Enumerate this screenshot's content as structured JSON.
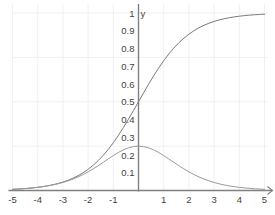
{
  "chart_data": {
    "type": "line",
    "title": "",
    "subtitle": "",
    "xlabel": "",
    "ylabel": "y",
    "xlim": [
      -5,
      5
    ],
    "ylim": [
      0,
      1.04
    ],
    "grid": true,
    "grid_color": "#f0f0f0",
    "legend": "none",
    "axis_color": "#808080",
    "text_color": "#3f3f3f",
    "x_ticks": [
      -5,
      -4,
      -3,
      -2,
      -1,
      1,
      2,
      3,
      4,
      5
    ],
    "x_tick_labels": [
      "-5",
      "-4",
      "-3",
      "-2",
      "-1",
      "1",
      "2",
      "3",
      "4",
      "5"
    ],
    "y_ticks": [
      0.1,
      0.2,
      0.3,
      0.4,
      0.5,
      0.6,
      0.7,
      0.8,
      0.9,
      1
    ],
    "y_tick_labels": [
      "0.1",
      "0.2",
      "0.3",
      "0.4",
      "0.5",
      "0.6",
      "0.7",
      "0.8",
      "0.9",
      "1"
    ],
    "x_gridlines": [
      -5,
      -4,
      -3,
      -2,
      -1,
      0,
      1,
      2,
      3,
      4,
      5
    ],
    "y_gridlines": [
      0.25,
      0.5,
      0.75,
      1
    ],
    "x_axis_arrow": true,
    "series": [
      {
        "name": "sigmoid",
        "color": "#7a7a7a",
        "width": 1,
        "x": [
          -5,
          -4.8,
          -4.6,
          -4.4,
          -4.2,
          -4,
          -3.8,
          -3.6,
          -3.4,
          -3.2,
          -3,
          -2.8,
          -2.6,
          -2.4,
          -2.2,
          -2,
          -1.8,
          -1.6,
          -1.4,
          -1.2,
          -1,
          -0.8,
          -0.6,
          -0.4,
          -0.2,
          0,
          0.2,
          0.4,
          0.6,
          0.8,
          1,
          1.2,
          1.4,
          1.6,
          1.8,
          2,
          2.2,
          2.4,
          2.6,
          2.8,
          3,
          3.2,
          3.4,
          3.6,
          3.8,
          4,
          4.2,
          4.4,
          4.6,
          4.8,
          5
        ],
        "y": [
          0.0067,
          0.0082,
          0.0099,
          0.0121,
          0.0148,
          0.018,
          0.0219,
          0.0266,
          0.0323,
          0.0392,
          0.0474,
          0.0573,
          0.0691,
          0.0832,
          0.0998,
          0.1192,
          0.1419,
          0.168,
          0.1978,
          0.2315,
          0.2689,
          0.31,
          0.3543,
          0.4013,
          0.4502,
          0.5,
          0.5498,
          0.5987,
          0.6457,
          0.69,
          0.7311,
          0.7685,
          0.8022,
          0.832,
          0.8581,
          0.8808,
          0.9002,
          0.9168,
          0.9309,
          0.9427,
          0.9526,
          0.9608,
          0.9677,
          0.9734,
          0.9781,
          0.982,
          0.9852,
          0.9879,
          0.9901,
          0.9918,
          0.9933
        ]
      },
      {
        "name": "sigmoid-derivative",
        "color": "#9a9a9a",
        "width": 1,
        "x": [
          -5,
          -4.8,
          -4.6,
          -4.4,
          -4.2,
          -4,
          -3.8,
          -3.6,
          -3.4,
          -3.2,
          -3,
          -2.8,
          -2.6,
          -2.4,
          -2.2,
          -2,
          -1.8,
          -1.6,
          -1.4,
          -1.2,
          -1,
          -0.8,
          -0.6,
          -0.4,
          -0.2,
          0,
          0.2,
          0.4,
          0.6,
          0.8,
          1,
          1.2,
          1.4,
          1.6,
          1.8,
          2,
          2.2,
          2.4,
          2.6,
          2.8,
          3,
          3.2,
          3.4,
          3.6,
          3.8,
          4,
          4.2,
          4.4,
          4.6,
          4.8,
          5
        ],
        "y": [
          0.0066,
          0.0081,
          0.0098,
          0.012,
          0.0146,
          0.0177,
          0.0214,
          0.0259,
          0.0313,
          0.0377,
          0.0452,
          0.054,
          0.0643,
          0.0763,
          0.0898,
          0.105,
          0.1218,
          0.1398,
          0.1587,
          0.1779,
          0.1966,
          0.2139,
          0.2288,
          0.2403,
          0.2475,
          0.25,
          0.2475,
          0.2403,
          0.2288,
          0.2139,
          0.1966,
          0.1779,
          0.1587,
          0.1398,
          0.1218,
          0.105,
          0.0898,
          0.0763,
          0.0643,
          0.054,
          0.0452,
          0.0377,
          0.0313,
          0.0259,
          0.0214,
          0.0177,
          0.0146,
          0.012,
          0.0098,
          0.0081,
          0.0066
        ]
      }
    ],
    "annotations": []
  }
}
